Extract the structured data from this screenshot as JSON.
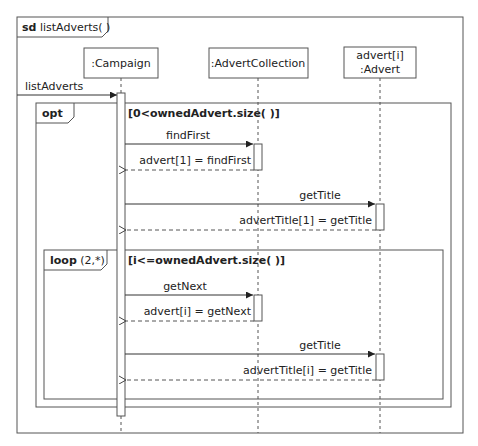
{
  "frame": {
    "keyword": "sd",
    "name": "listAdverts( )"
  },
  "lifelines": [
    {
      "id": "campaign",
      "label_line1": ":Campaign",
      "label_line2": ""
    },
    {
      "id": "collection",
      "label_line1": ":AdvertCollection",
      "label_line2": ""
    },
    {
      "id": "advert",
      "label_line1": "advert[i]",
      "label_line2": ":Advert"
    }
  ],
  "found_message": {
    "label": "listAdverts"
  },
  "opt_fragment": {
    "operator": "opt",
    "guard": "[0<ownedAdvert.size( )]"
  },
  "loop_fragment": {
    "operator": "loop",
    "args": "(2,*)",
    "guard": "[i<=ownedAdvert.size( )]"
  },
  "messages": [
    {
      "label": "findFirst",
      "type": "sync"
    },
    {
      "label": "advert[1] = findFirst",
      "type": "reply"
    },
    {
      "label": "getTitle",
      "type": "sync"
    },
    {
      "label": "advertTitle[1] = getTitle",
      "type": "reply"
    },
    {
      "label": "getNext",
      "type": "sync"
    },
    {
      "label": "advert[i] = getNext",
      "type": "reply"
    },
    {
      "label": "getTitle",
      "type": "sync"
    },
    {
      "label": "advertTitle[i] = getTitle",
      "type": "reply"
    }
  ]
}
